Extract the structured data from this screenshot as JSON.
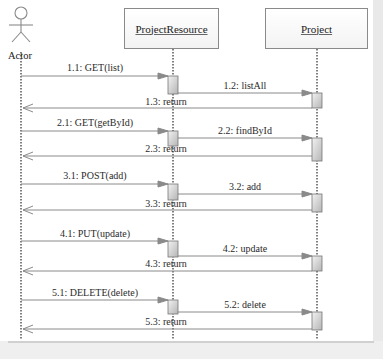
{
  "diagram": {
    "type": "sequence",
    "colors": {
      "line": "#8a8a8a",
      "lifeline": "#555555",
      "activation_fill_top": "#f2f2f2",
      "activation_fill_bottom": "#b9b9b9",
      "border": "#e9e9e9"
    },
    "actor": {
      "label": "Actor",
      "icon": "stick-figure-icon"
    },
    "participants": [
      {
        "id": "resource",
        "label": "ProjectResource"
      },
      {
        "id": "project",
        "label": "Project"
      }
    ],
    "messages": [
      {
        "num": "1.1",
        "label": "1.1: GET(list)",
        "from": "actor",
        "to": "resource",
        "kind": "call"
      },
      {
        "num": "1.2",
        "label": "1.2: listAll",
        "from": "resource",
        "to": "project",
        "kind": "call"
      },
      {
        "num": "1.3",
        "label": "1.3: return",
        "from": "project",
        "to": "actor",
        "kind": "return"
      },
      {
        "num": "2.1",
        "label": "2.1: GET(getById)",
        "from": "actor",
        "to": "resource",
        "kind": "call"
      },
      {
        "num": "2.2",
        "label": "2.2: findById",
        "from": "resource",
        "to": "project",
        "kind": "call"
      },
      {
        "num": "2.3",
        "label": "2.3: return",
        "from": "project",
        "to": "actor",
        "kind": "return"
      },
      {
        "num": "3.1",
        "label": "3.1: POST(add)",
        "from": "actor",
        "to": "resource",
        "kind": "call"
      },
      {
        "num": "3.2",
        "label": "3.2: add",
        "from": "resource",
        "to": "project",
        "kind": "call"
      },
      {
        "num": "3.3",
        "label": "3.3: return",
        "from": "project",
        "to": "actor",
        "kind": "return"
      },
      {
        "num": "4.1",
        "label": "4.1: PUT(update)",
        "from": "actor",
        "to": "resource",
        "kind": "call"
      },
      {
        "num": "4.2",
        "label": "4.2: update",
        "from": "resource",
        "to": "project",
        "kind": "call"
      },
      {
        "num": "4.3",
        "label": "4.3: return",
        "from": "project",
        "to": "actor",
        "kind": "return"
      },
      {
        "num": "5.1",
        "label": "5.1: DELETE(delete)",
        "from": "actor",
        "to": "resource",
        "kind": "call"
      },
      {
        "num": "5.2",
        "label": "5.2: delete",
        "from": "resource",
        "to": "project",
        "kind": "call"
      },
      {
        "num": "5.3",
        "label": "5.3: return",
        "from": "project",
        "to": "actor",
        "kind": "return"
      }
    ]
  }
}
